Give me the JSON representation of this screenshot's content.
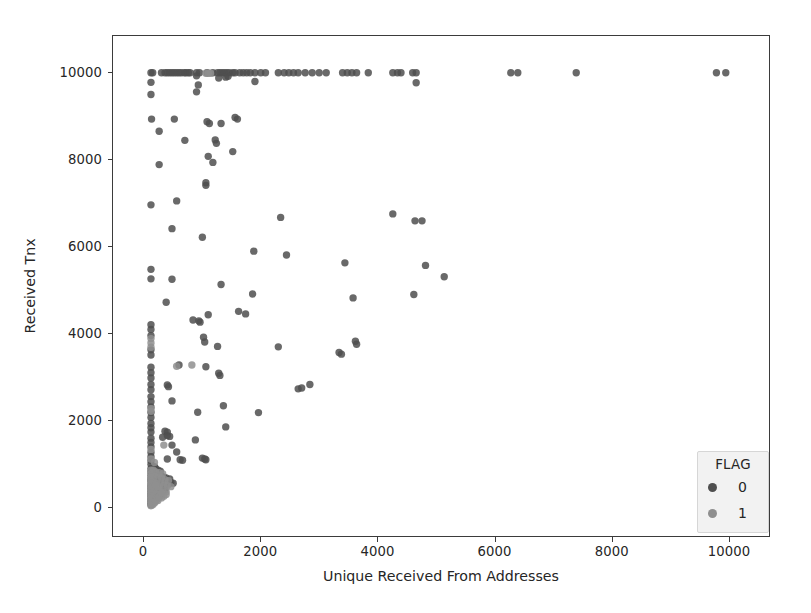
{
  "figure": {
    "background": "#ffffff",
    "axes_edge_color": "#3b3b3b",
    "width": 811,
    "height": 613
  },
  "chart_data": {
    "type": "scatter",
    "title": "",
    "xlabel": "Unique Received From Addresses",
    "ylabel": "Received Tnx",
    "xlim": [
      -530,
      10700
    ],
    "ylim": [
      -700,
      10850
    ],
    "xticks": [
      0,
      2000,
      4000,
      6000,
      8000,
      10000
    ],
    "yticks": [
      0,
      2000,
      4000,
      6000,
      8000,
      10000
    ],
    "xticklabels": [
      "0",
      "2000",
      "4000",
      "6000",
      "8000",
      "10000"
    ],
    "yticklabels": [
      "0",
      "2000",
      "4000",
      "6000",
      "8000",
      "10000"
    ],
    "grid": false,
    "marker": "circle",
    "marker_size_px": 7.4,
    "marker_alpha": 0.85,
    "legend": {
      "title": "FLAG",
      "position": "lower right",
      "facecolor": "#f2f2f2",
      "edgecolor": "#d6d6d6",
      "entries": [
        {
          "label": "0",
          "color": "#4f4f4f"
        },
        {
          "label": "1",
          "color": "#8f8f8f"
        }
      ]
    },
    "series": [
      {
        "name": "0",
        "flag": 0,
        "color": "#4f4f4f",
        "points": [
          [
            120,
            10000
          ],
          [
            150,
            10000
          ],
          [
            300,
            10000
          ],
          [
            360,
            10000
          ],
          [
            400,
            10000
          ],
          [
            440,
            10000
          ],
          [
            480,
            10000
          ],
          [
            520,
            10000
          ],
          [
            560,
            10000
          ],
          [
            600,
            10000
          ],
          [
            640,
            10000
          ],
          [
            690,
            10000
          ],
          [
            720,
            10000
          ],
          [
            760,
            10000
          ],
          [
            790,
            10000
          ],
          [
            900,
            10000
          ],
          [
            950,
            10000
          ],
          [
            1080,
            10000
          ],
          [
            1180,
            10000
          ],
          [
            1260,
            10000
          ],
          [
            1300,
            10000
          ],
          [
            1340,
            10000
          ],
          [
            1380,
            10000
          ],
          [
            1420,
            10000
          ],
          [
            1460,
            10000
          ],
          [
            1520,
            10000
          ],
          [
            1560,
            10000
          ],
          [
            1640,
            10000
          ],
          [
            1700,
            10000
          ],
          [
            1760,
            10000
          ],
          [
            1820,
            10000
          ],
          [
            1900,
            10000
          ],
          [
            2000,
            10000
          ],
          [
            2080,
            10000
          ],
          [
            2300,
            10000
          ],
          [
            2400,
            10000
          ],
          [
            2480,
            10000
          ],
          [
            2560,
            10000
          ],
          [
            2640,
            10000
          ],
          [
            2760,
            10000
          ],
          [
            2880,
            10000
          ],
          [
            3000,
            10000
          ],
          [
            3120,
            10000
          ],
          [
            3400,
            10000
          ],
          [
            3480,
            10000
          ],
          [
            3560,
            10000
          ],
          [
            3640,
            10000
          ],
          [
            3840,
            10000
          ],
          [
            4260,
            10000
          ],
          [
            4340,
            10000
          ],
          [
            4400,
            10000
          ],
          [
            4600,
            10000
          ],
          [
            4660,
            10000
          ],
          [
            6280,
            10000
          ],
          [
            6400,
            10000
          ],
          [
            7400,
            10000
          ],
          [
            9800,
            10000
          ],
          [
            9960,
            10000
          ],
          [
            120,
            9780
          ],
          [
            900,
            9930
          ],
          [
            930,
            9720
          ],
          [
            1280,
            9880
          ],
          [
            1400,
            9900
          ],
          [
            1440,
            9920
          ],
          [
            1900,
            9800
          ],
          [
            4660,
            9770
          ],
          [
            120,
            9500
          ],
          [
            900,
            9560
          ],
          [
            130,
            8930
          ],
          [
            520,
            8930
          ],
          [
            1080,
            8870
          ],
          [
            1120,
            8830
          ],
          [
            1320,
            8830
          ],
          [
            1560,
            8970
          ],
          [
            1600,
            8930
          ],
          [
            1220,
            8450
          ],
          [
            260,
            8650
          ],
          [
            700,
            8440
          ],
          [
            1240,
            8370
          ],
          [
            1520,
            8180
          ],
          [
            1100,
            8070
          ],
          [
            1180,
            7930
          ],
          [
            260,
            7880
          ],
          [
            1060,
            7460
          ],
          [
            1060,
            7400
          ],
          [
            560,
            7040
          ],
          [
            120,
            6950
          ],
          [
            2340,
            6660
          ],
          [
            4260,
            6740
          ],
          [
            4640,
            6580
          ],
          [
            4760,
            6580
          ],
          [
            480,
            6400
          ],
          [
            1000,
            6200
          ],
          [
            1880,
            5880
          ],
          [
            2440,
            5790
          ],
          [
            3440,
            5610
          ],
          [
            4820,
            5550
          ],
          [
            5140,
            5290
          ],
          [
            120,
            5460
          ],
          [
            120,
            5240
          ],
          [
            480,
            5230
          ],
          [
            1320,
            5110
          ],
          [
            1860,
            4890
          ],
          [
            4620,
            4880
          ],
          [
            3580,
            4800
          ],
          [
            380,
            4700
          ],
          [
            1620,
            4490
          ],
          [
            1740,
            4430
          ],
          [
            1100,
            4410
          ],
          [
            840,
            4290
          ],
          [
            940,
            4270
          ],
          [
            960,
            4240
          ],
          [
            120,
            4180
          ],
          [
            120,
            4070
          ],
          [
            120,
            3930
          ],
          [
            1020,
            3890
          ],
          [
            1040,
            3780
          ],
          [
            3620,
            3800
          ],
          [
            3640,
            3730
          ],
          [
            1260,
            3680
          ],
          [
            2300,
            3670
          ],
          [
            3340,
            3540
          ],
          [
            3380,
            3500
          ],
          [
            120,
            3600
          ],
          [
            120,
            3480
          ],
          [
            600,
            3250
          ],
          [
            1060,
            3210
          ],
          [
            1280,
            3060
          ],
          [
            1300,
            3010
          ],
          [
            120,
            3200
          ],
          [
            120,
            3070
          ],
          [
            120,
            2950
          ],
          [
            2640,
            2700
          ],
          [
            2700,
            2720
          ],
          [
            2840,
            2800
          ],
          [
            400,
            2790
          ],
          [
            420,
            2750
          ],
          [
            120,
            2800
          ],
          [
            120,
            2680
          ],
          [
            480,
            2420
          ],
          [
            1360,
            2310
          ],
          [
            120,
            2520
          ],
          [
            120,
            2400
          ],
          [
            120,
            2280
          ],
          [
            920,
            2160
          ],
          [
            1960,
            2150
          ],
          [
            120,
            2150
          ],
          [
            120,
            2040
          ],
          [
            1400,
            1820
          ],
          [
            120,
            1900
          ],
          [
            120,
            1800
          ],
          [
            120,
            1700
          ],
          [
            360,
            1720
          ],
          [
            400,
            1700
          ],
          [
            400,
            1620
          ],
          [
            440,
            1600
          ],
          [
            320,
            1580
          ],
          [
            880,
            1520
          ],
          [
            480,
            1400
          ],
          [
            120,
            1560
          ],
          [
            120,
            1460
          ],
          [
            120,
            1360
          ],
          [
            560,
            1240
          ],
          [
            120,
            1230
          ],
          [
            120,
            1130
          ],
          [
            400,
            1080
          ],
          [
            620,
            1060
          ],
          [
            660,
            1050
          ],
          [
            1000,
            1100
          ],
          [
            1040,
            1080
          ],
          [
            1060,
            1060
          ],
          [
            120,
            1040
          ],
          [
            120,
            960
          ],
          [
            180,
            900
          ],
          [
            200,
            860
          ],
          [
            240,
            820
          ],
          [
            280,
            800
          ],
          [
            120,
            860
          ],
          [
            120,
            780
          ],
          [
            120,
            700
          ],
          [
            160,
            740
          ],
          [
            220,
            720
          ],
          [
            260,
            700
          ],
          [
            300,
            680
          ],
          [
            340,
            660
          ],
          [
            380,
            640
          ],
          [
            440,
            620
          ],
          [
            120,
            620
          ],
          [
            120,
            560
          ],
          [
            160,
            580
          ],
          [
            200,
            560
          ],
          [
            240,
            540
          ],
          [
            300,
            520
          ],
          [
            340,
            500
          ],
          [
            380,
            520
          ],
          [
            420,
            500
          ],
          [
            460,
            540
          ],
          [
            500,
            520
          ],
          [
            120,
            480
          ],
          [
            120,
            420
          ],
          [
            180,
            440
          ],
          [
            220,
            420
          ],
          [
            260,
            400
          ],
          [
            320,
            380
          ],
          [
            360,
            360
          ],
          [
            120,
            360
          ],
          [
            120,
            300
          ],
          [
            160,
            320
          ],
          [
            200,
            300
          ],
          [
            240,
            280
          ],
          [
            280,
            260
          ],
          [
            120,
            240
          ],
          [
            120,
            180
          ],
          [
            160,
            200
          ],
          [
            200,
            180
          ],
          [
            120,
            120
          ],
          [
            160,
            120
          ],
          [
            120,
            60
          ],
          [
            120,
            20
          ]
        ]
      },
      {
        "name": "1",
        "flag": 1,
        "color": "#8f8f8f",
        "points": [
          [
            1060,
            9990
          ],
          [
            1100,
            9990
          ],
          [
            1140,
            9990
          ],
          [
            560,
            3220
          ],
          [
            820,
            3250
          ],
          [
            120,
            3860
          ],
          [
            120,
            3760
          ],
          [
            120,
            3660
          ],
          [
            120,
            2240
          ],
          [
            120,
            2180
          ],
          [
            340,
            1400
          ],
          [
            120,
            1300
          ],
          [
            180,
            1000
          ],
          [
            120,
            1080
          ],
          [
            160,
            820
          ],
          [
            200,
            780
          ],
          [
            260,
            760
          ],
          [
            320,
            740
          ],
          [
            120,
            820
          ],
          [
            120,
            740
          ],
          [
            140,
            700
          ],
          [
            180,
            680
          ],
          [
            240,
            660
          ],
          [
            300,
            640
          ],
          [
            360,
            600
          ],
          [
            420,
            580
          ],
          [
            120,
            660
          ],
          [
            120,
            600
          ],
          [
            140,
            560
          ],
          [
            180,
            540
          ],
          [
            220,
            520
          ],
          [
            280,
            500
          ],
          [
            340,
            480
          ],
          [
            400,
            460
          ],
          [
            460,
            440
          ],
          [
            120,
            520
          ],
          [
            120,
            460
          ],
          [
            140,
            420
          ],
          [
            180,
            400
          ],
          [
            220,
            380
          ],
          [
            260,
            360
          ],
          [
            320,
            340
          ],
          [
            380,
            320
          ],
          [
            120,
            400
          ],
          [
            120,
            340
          ],
          [
            140,
            300
          ],
          [
            180,
            280
          ],
          [
            220,
            260
          ],
          [
            280,
            240
          ],
          [
            120,
            280
          ],
          [
            120,
            220
          ],
          [
            140,
            180
          ],
          [
            180,
            160
          ],
          [
            220,
            140
          ],
          [
            120,
            160
          ],
          [
            120,
            100
          ],
          [
            140,
            80
          ],
          [
            180,
            60
          ],
          [
            120,
            40
          ],
          [
            150,
            20
          ],
          [
            120,
            0
          ],
          [
            200,
            100
          ],
          [
            240,
            120
          ],
          [
            300,
            180
          ],
          [
            260,
            200
          ],
          [
            340,
            220
          ],
          [
            380,
            260
          ],
          [
            300,
            300
          ],
          [
            240,
            440
          ],
          [
            200,
            480
          ]
        ]
      }
    ]
  },
  "axis": {
    "x_title": "Unique Received From Addresses",
    "y_title": "Received Tnx"
  }
}
